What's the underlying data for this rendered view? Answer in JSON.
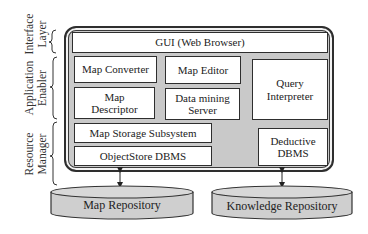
{
  "diagram": {
    "layers": [
      {
        "id": "interface",
        "label_line1": "Interface",
        "label_line2": "Layer"
      },
      {
        "id": "application",
        "label_line1": "Application",
        "label_line2": "Enabler"
      },
      {
        "id": "resource",
        "label_line1": "Resource",
        "label_line2": "Manager"
      }
    ],
    "components": {
      "gui": "GUI (Web Browser)",
      "map_converter": "Map Converter",
      "map_editor": "Map Editor",
      "map_descriptor_line1": "Map",
      "map_descriptor_line2": "Descriptor",
      "data_mining_line1": "Data mining",
      "data_mining_line2": "Server",
      "query_line1": "Query",
      "query_line2": "Interpreter",
      "map_storage": "Map Storage Subsystem",
      "objectstore": "ObjectStore DBMS",
      "deductive_line1": "Deductive",
      "deductive_line2": "DBMS"
    },
    "repositories": {
      "map_repository": "Map Repository",
      "knowledge_repository": "Knowledge Repository"
    },
    "connections": [
      {
        "from": "ObjectStore DBMS",
        "to": "Map Repository",
        "type": "bidirectional-arrow"
      },
      {
        "from": "Deductive DBMS",
        "to": "Knowledge Repository",
        "type": "bidirectional-arrow"
      }
    ],
    "colors": {
      "frame_fill": "#c9c9c9",
      "cylinder_fill": "#cfcfcf",
      "box_fill": "#ffffff",
      "stroke": "#2e2e2e"
    }
  }
}
